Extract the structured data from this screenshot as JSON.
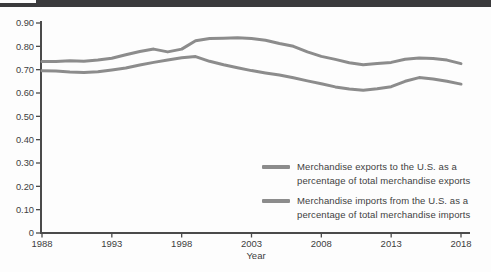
{
  "page": {
    "top_bar_color": "#3a3a3c",
    "axis_color": "#4b4b4b",
    "text_color": "#3d3d3d"
  },
  "chart_data": {
    "type": "line",
    "title": "",
    "xlabel": "Year",
    "ylabel": "",
    "xlim": [
      1988,
      2018
    ],
    "ylim": [
      0,
      0.9
    ],
    "grid": false,
    "legend_position": "inside lower right",
    "xtick_values": [
      1988,
      1993,
      1998,
      2003,
      2008,
      2013,
      2018
    ],
    "xtick_labels": [
      "1988",
      "1993",
      "1998",
      "2003",
      "2008",
      "2013",
      "2018"
    ],
    "ytick_values": [
      0,
      0.1,
      0.2,
      0.3,
      0.4,
      0.5,
      0.6,
      0.7,
      0.8,
      0.9
    ],
    "ytick_labels": [
      "0",
      "0.10",
      "0.20",
      "0.30",
      "0.40",
      "0.50",
      "0.60",
      "0.70",
      "0.80",
      "0.90"
    ],
    "x": [
      1988,
      1989,
      1990,
      1991,
      1992,
      1993,
      1994,
      1995,
      1996,
      1997,
      1998,
      1999,
      2000,
      2001,
      2002,
      2003,
      2004,
      2005,
      2006,
      2007,
      2008,
      2009,
      2010,
      2011,
      2012,
      2013,
      2014,
      2015,
      2016,
      2017,
      2018
    ],
    "series": [
      {
        "name": "exports",
        "label_line1": "Merchandise exports to the U.S. as a",
        "label_line2": "percentage of total merchandise exports",
        "color": "#8c8c8c",
        "values": [
          0.735,
          0.735,
          0.738,
          0.736,
          0.741,
          0.749,
          0.764,
          0.778,
          0.788,
          0.776,
          0.788,
          0.824,
          0.834,
          0.835,
          0.837,
          0.833,
          0.826,
          0.812,
          0.8,
          0.776,
          0.757,
          0.744,
          0.73,
          0.721,
          0.726,
          0.731,
          0.745,
          0.75,
          0.748,
          0.741,
          0.726
        ]
      },
      {
        "name": "imports",
        "label_line1": "Merchandise imports from the U.S. as a",
        "label_line2": "percentage of total merchandise imports",
        "color": "#8c8c8c",
        "values": [
          0.695,
          0.694,
          0.69,
          0.688,
          0.691,
          0.699,
          0.707,
          0.72,
          0.731,
          0.742,
          0.751,
          0.756,
          0.736,
          0.721,
          0.708,
          0.696,
          0.686,
          0.677,
          0.665,
          0.652,
          0.64,
          0.626,
          0.617,
          0.612,
          0.618,
          0.627,
          0.65,
          0.666,
          0.66,
          0.65,
          0.638
        ]
      }
    ]
  }
}
